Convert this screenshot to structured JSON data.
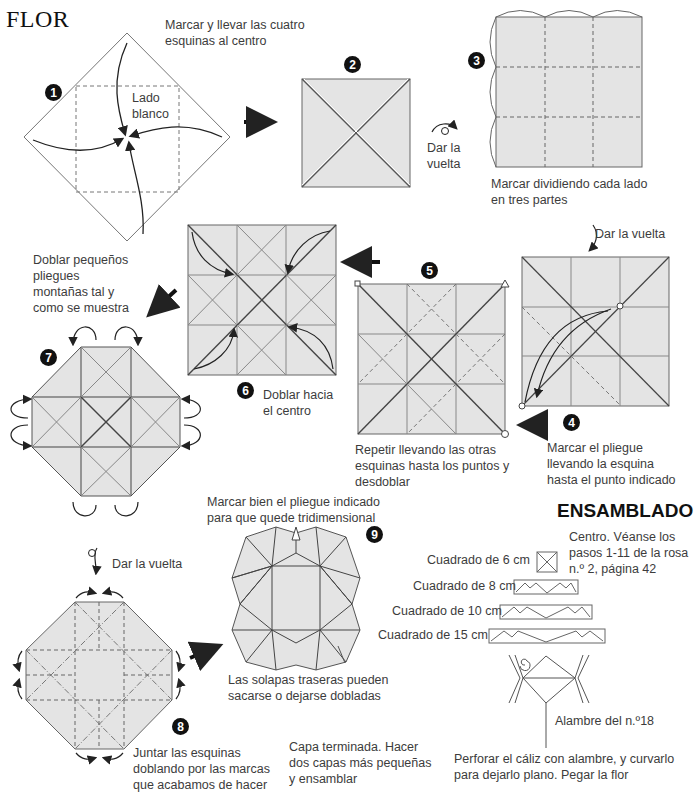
{
  "title": "FLOR",
  "colors": {
    "paper": "#e4e4e4",
    "line": "#555555",
    "text": "#3c3c3c",
    "badge": "#111111"
  },
  "steps": [
    {
      "number": "1",
      "caption": "Marcar y llevar las cuatro\nesquinas al centro",
      "inner_label": "Lado\nblanco"
    },
    {
      "number": "2",
      "caption": ""
    },
    {
      "number": "3",
      "caption": "Marcar dividiendo cada lado\nen tres partes",
      "turn_label": "Dar la\nvuelta"
    },
    {
      "number": "4",
      "caption": "Marcar el pliegue\nllevando la esquina\nhasta el punto indicado",
      "turn_label": "Dar la vuelta"
    },
    {
      "number": "5",
      "caption": "Repetir llevando las otras\nesquinas hasta los puntos y\ndesdoblar"
    },
    {
      "number": "6",
      "caption": "Doblar hacia\nel centro"
    },
    {
      "number": "7",
      "caption": "Doblar pequeños\npliegues\nmontañas tal y\ncomo se muestra"
    },
    {
      "number": "8",
      "caption": "Juntar las esquinas\ndoblando por las marcas\nque acabamos de hacer",
      "turn_label": "Dar la vuelta"
    },
    {
      "number": "9",
      "caption_top": "Marcar bien el pliegue indicado\npara que quede tridimensional",
      "caption_bottom": "Las solapas traseras pueden\nsacarse o dejarse dobladas",
      "caption_final": "Capa terminada. Hacer\ndos capas más pequeñas\ny ensamblar"
    }
  ],
  "assembly": {
    "heading": "ENSAMBLADO",
    "center_note": "Centro. Véanse los\npasos 1-11 de la rosa\nn.º 2, página 42",
    "layers": [
      {
        "label": "Cuadrado de 6 cm"
      },
      {
        "label": "Cuadrado de 8 cm"
      },
      {
        "label": "Cuadrado de 10 cm"
      },
      {
        "label": "Cuadrado de 15 cm"
      }
    ],
    "wire_label": "Alambre del n.º18",
    "final_note": "Perforar el cáliz con alambre, y curvarlo\npara dejarlo plano. Pegar la flor"
  }
}
